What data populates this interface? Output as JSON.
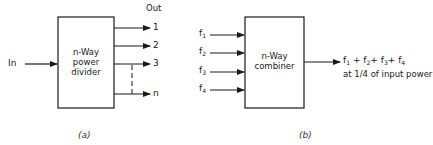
{
  "diagram_a": {
    "caption": "(a)",
    "input_label": "In",
    "output_header": "Out",
    "box_lines": [
      "n-Way",
      "power",
      "divider"
    ],
    "outputs": [
      "1",
      "2",
      "3",
      "n"
    ]
  },
  "diagram_b": {
    "caption": "(b)",
    "inputs": [
      {
        "base": "f",
        "sub": "1"
      },
      {
        "base": "f",
        "sub": "2"
      },
      {
        "base": "f",
        "sub": "3"
      },
      {
        "base": "f",
        "sub": "4"
      }
    ],
    "box_lines": [
      "n-Way",
      "combiner"
    ],
    "output_line1": {
      "terms": [
        {
          "base": "f",
          "sub": "1"
        },
        {
          "base": "f",
          "sub": "2"
        },
        {
          "base": "f",
          "sub": "3"
        },
        {
          "base": "f",
          "sub": "4"
        }
      ],
      "separator": "+"
    },
    "output_line2": "at 1/4 of input power"
  },
  "colors": {
    "stroke": "#1a1a1a",
    "background": "#ffffff"
  }
}
